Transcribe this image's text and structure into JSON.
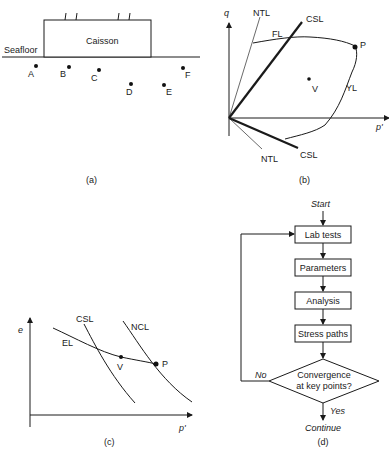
{
  "panel_a": {
    "caption": "(a)",
    "caisson_label": "Caisson",
    "seafloor_label": "Seafloor",
    "points": [
      {
        "label": "A",
        "x": 36,
        "y": 65
      },
      {
        "label": "B",
        "x": 69,
        "y": 67
      },
      {
        "label": "C",
        "x": 99,
        "y": 70
      },
      {
        "label": "D",
        "x": 131,
        "y": 83
      },
      {
        "label": "E",
        "x": 164,
        "y": 85
      },
      {
        "label": "F",
        "x": 183,
        "y": 68
      }
    ]
  },
  "panel_b": {
    "caption": "(b)",
    "axis_y": "q",
    "axis_x": "p'",
    "labels": {
      "ntl_top": "NTL",
      "csl_top": "CSL",
      "fl": "FL",
      "p": "P",
      "v": "V",
      "yl": "YL",
      "ntl_bottom": "NTL",
      "csl_bottom": "CSL"
    }
  },
  "panel_c": {
    "caption": "(c)",
    "axis_y": "e",
    "axis_x": "p'",
    "labels": {
      "csl": "CSL",
      "ncl": "NCL",
      "el": "EL",
      "v": "V",
      "p": "P"
    }
  },
  "panel_d": {
    "caption": "(d)",
    "start": "Start",
    "steps": [
      "Lab tests",
      "Parameters",
      "Analysis",
      "Stress paths"
    ],
    "decision_line1": "Convergence",
    "decision_line2": "at key points?",
    "no_label": "No",
    "yes_label": "Yes",
    "end": "Continue"
  }
}
